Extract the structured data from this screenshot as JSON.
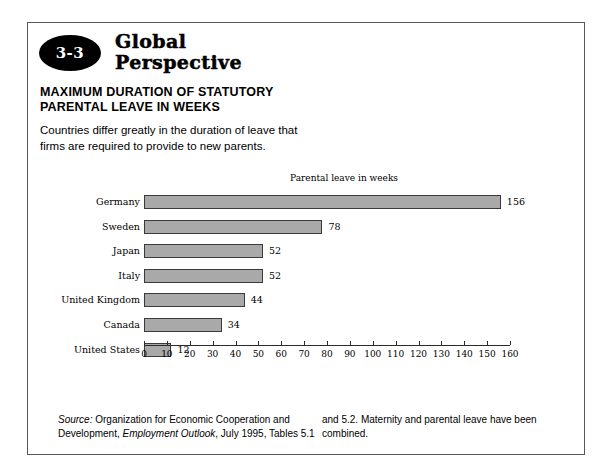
{
  "box": {
    "badge_number": "3-3",
    "kicker_line1": "Global",
    "kicker_line2": "Perspective",
    "headline_line1": "MAXIMUM DURATION OF STATUTORY",
    "headline_line2": "PARENTAL LEAVE IN WEEKS",
    "lede_line1": "Countries differ greatly in the duration of leave that",
    "lede_line2": "firms are required to provide to new parents."
  },
  "chart_data": {
    "type": "bar",
    "orientation": "horizontal",
    "title": "Parental leave in weeks",
    "xlabel": "",
    "ylabel": "",
    "categories": [
      "Germany",
      "Sweden",
      "Japan",
      "Italy",
      "United Kingdom",
      "Canada",
      "United States"
    ],
    "values": [
      156,
      78,
      52,
      52,
      44,
      34,
      12
    ],
    "value_labels": [
      "156",
      "78",
      "52",
      "52",
      "44",
      "34",
      "12"
    ],
    "xlim": [
      0,
      160
    ],
    "xticks": [
      0,
      10,
      20,
      30,
      40,
      50,
      60,
      70,
      80,
      90,
      100,
      110,
      120,
      130,
      140,
      150,
      160
    ],
    "xtick_labels": [
      "0",
      "10",
      "20",
      "30",
      "40",
      "50",
      "60",
      "70",
      "80",
      "90",
      "100",
      "110",
      "120",
      "130",
      "140",
      "150",
      "160"
    ],
    "grid": false,
    "legend": false,
    "bar_fill": "#a9a9a9",
    "bar_stroke": "#3a3a3a"
  },
  "source": {
    "label": "Source:",
    "col1_line1_rest": " Organization for Economic Cooperation and",
    "col1_line2_a": "Development, ",
    "col1_line2_ital": "Employment Outlook",
    "col1_line2_b": ", July 1995, Tables 5.1",
    "col2_line1": "and 5.2. Maternity and parental leave have been",
    "col2_line2": "combined."
  }
}
